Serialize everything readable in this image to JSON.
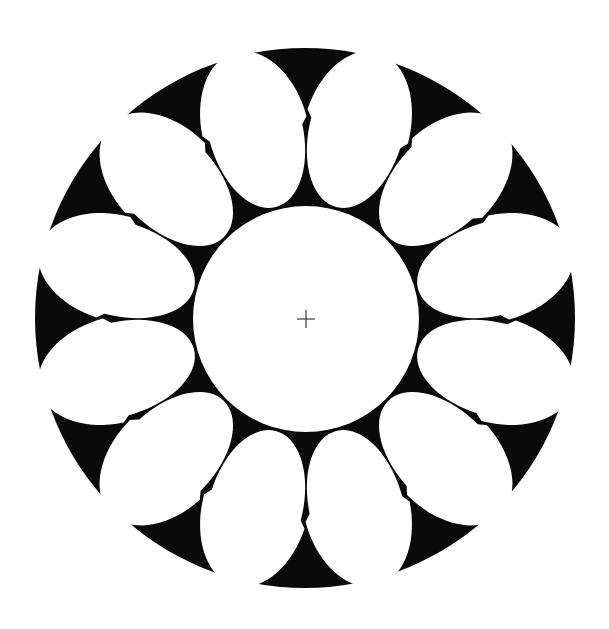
{
  "figure": {
    "description": "Black disc with twelve white egg-shaped petals arranged in a ring around a central white circle marked with a crosshair",
    "canvas": {
      "width": 609,
      "height": 629,
      "background": "#ffffff"
    },
    "colors": {
      "disc": "#0a0a0a",
      "petal": "#ffffff",
      "center_circle": "#ffffff",
      "crosshair": "#3a3a3a"
    },
    "outer_disc": {
      "cx": 305,
      "cy": 318,
      "r": 270
    },
    "center_circle": {
      "cx": 306,
      "cy": 319,
      "r": 113
    },
    "crosshair": {
      "cx": 306,
      "cy": 319,
      "half_length": 9,
      "stroke_width": 1.2
    },
    "petals": {
      "count": 12,
      "start_angle_deg": 15,
      "step_deg": 30,
      "distance_from_center": 196,
      "radial_half_length": 80,
      "tangential_half_width_inner": 47,
      "tangential_half_width_outer": 53
    }
  }
}
